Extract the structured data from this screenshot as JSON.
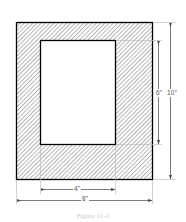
{
  "figure": {
    "caption": "Figure 11-2",
    "shape_type": "hatched rectangular frame",
    "outer": {
      "label_width": "8\"",
      "label_height": "10\"",
      "width_value": 8,
      "height_value": 10,
      "units": "inches"
    },
    "inner": {
      "label_width": "4\"",
      "label_height": "6\"",
      "width_value": 4,
      "height_value": 6,
      "units": "inches"
    },
    "dimensions": [
      {
        "name": "inner-height",
        "label": "6\"",
        "orientation": "vertical"
      },
      {
        "name": "outer-height",
        "label": "10\"",
        "orientation": "vertical"
      },
      {
        "name": "inner-width",
        "label": "4\"",
        "orientation": "horizontal"
      },
      {
        "name": "outer-width",
        "label": "8\"",
        "orientation": "horizontal"
      }
    ],
    "colors": {
      "outline": "#000000",
      "hatch": "#7a7a7a",
      "dimension_line": "#6d6d6d",
      "extension_line": "#bdbdbd",
      "dimension_text": "#555555",
      "caption_text": "#c9c9c9",
      "background": "#ffffff",
      "void_fill": "#ffffff"
    }
  }
}
